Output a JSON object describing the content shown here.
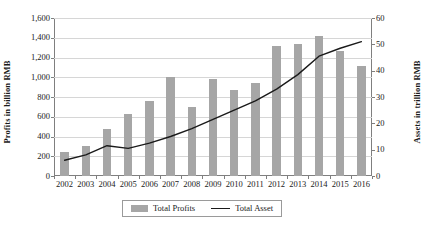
{
  "chart_data": {
    "type": "bar",
    "title": "",
    "subtitle": "",
    "xlabel": "",
    "ylabel": "Profits in billion RMB",
    "ylabel_secondary": "Assets in trillion RMB",
    "grid": true,
    "legend_position": "bottom",
    "categories": [
      "2002",
      "2003",
      "2004",
      "2005",
      "2006",
      "2007",
      "2008",
      "2009",
      "2010",
      "2011",
      "2012",
      "2013",
      "2014",
      "2015",
      "2016"
    ],
    "ylim": [
      0,
      1600
    ],
    "yticks": [
      0,
      200,
      400,
      600,
      800,
      1000,
      1200,
      1400,
      1600
    ],
    "ytick_labels": [
      "0",
      "200",
      "400",
      "600",
      "800",
      "1,000",
      "1,200",
      "1,400",
      "1,600"
    ],
    "ylim_secondary": [
      0,
      60
    ],
    "yticks_secondary": [
      0,
      10,
      20,
      30,
      40,
      50,
      60
    ],
    "ytick_labels_secondary": [
      "0",
      "10",
      "20",
      "30",
      "40",
      "50",
      "60"
    ],
    "series": [
      {
        "name": "Total Profits",
        "kind": "bar",
        "axis": "left",
        "unit": "billion RMB",
        "color": "#a6a6a6",
        "values": [
          240,
          300,
          480,
          630,
          760,
          1000,
          700,
          980,
          870,
          940,
          1320,
          1340,
          1420,
          1270,
          1110
        ]
      },
      {
        "name": "Total Asset",
        "kind": "line",
        "axis": "right",
        "unit": "trillion RMB",
        "color": "#1a1a1a",
        "values": [
          6.0,
          8.0,
          11.5,
          10.5,
          12.5,
          15.0,
          18.0,
          21.5,
          25.0,
          28.5,
          33.0,
          38.5,
          45.5,
          48.5,
          51.0
        ]
      }
    ]
  },
  "legend": {
    "items": [
      {
        "label": "Total Profits",
        "marker": "bar-swatch-icon"
      },
      {
        "label": "Total Asset",
        "marker": "line-swatch-icon"
      }
    ]
  }
}
